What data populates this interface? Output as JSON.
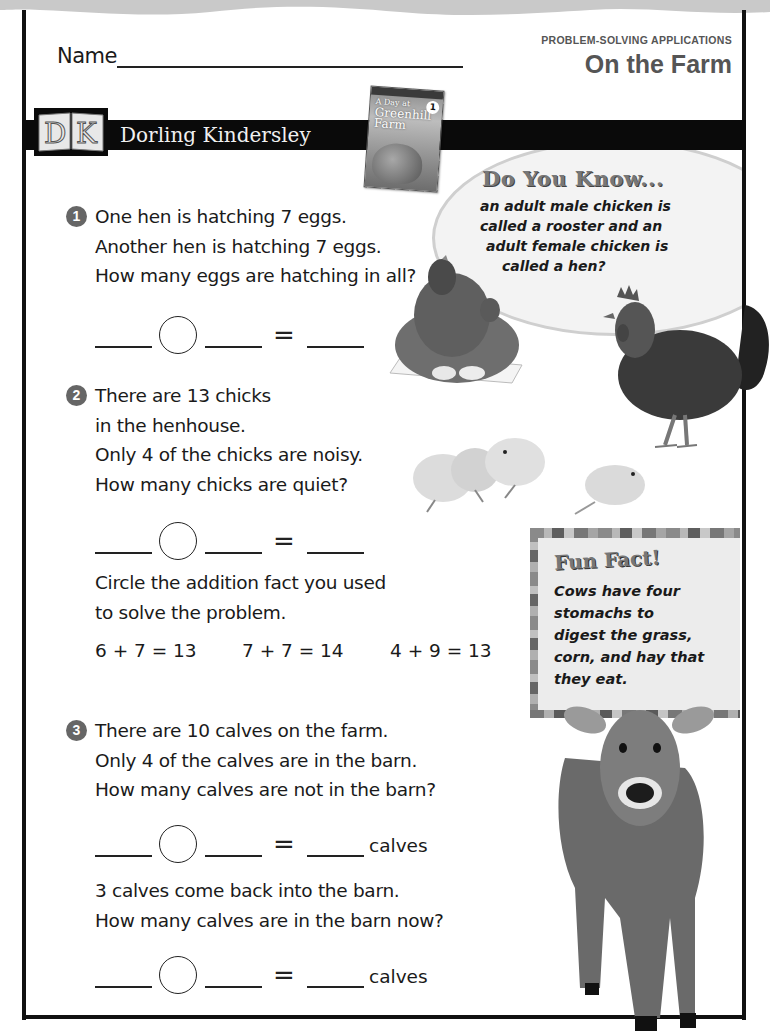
{
  "header": {
    "name_label": "Name",
    "section_label": "PROBLEM-SOLVING APPLICATIONS",
    "title": "On the Farm"
  },
  "publisher": {
    "logo_letters": "DK",
    "name": "Dorling Kindersley"
  },
  "book": {
    "title_line1": "A Day at",
    "title_line2": "Greenhill",
    "title_line3": "Farm",
    "level": "1"
  },
  "do_you_know": {
    "title": "Do You Know...",
    "lines": [
      "an adult male chicken is",
      "called a rooster and an",
      "adult female chicken is",
      "called a hen?"
    ]
  },
  "questions": [
    {
      "number": "1",
      "lines": [
        "One hen is hatching 7 eggs.",
        "Another hen is hatching 7 eggs.",
        "How many eggs are hatching in all?"
      ],
      "equation": {
        "equals": "=",
        "unit": ""
      }
    },
    {
      "number": "2",
      "lines": [
        "There are 13 chicks",
        "in the henhouse.",
        "Only 4 of the chicks are noisy.",
        "How many chicks are quiet?"
      ],
      "equation": {
        "equals": "=",
        "unit": ""
      },
      "followup_lines": [
        "Circle the addition fact you used",
        "to solve the problem."
      ],
      "facts": [
        "6 + 7 = 13",
        "7 + 7 = 14",
        "4 + 9 = 13"
      ]
    },
    {
      "number": "3",
      "lines": [
        "There are 10 calves on the farm.",
        "Only 4 of the calves are in the barn.",
        "How many calves are not in the barn?"
      ],
      "equation": {
        "equals": "=",
        "unit": "calves"
      },
      "followup_lines": [
        "3 calves come back into the barn.",
        "How many calves are in the barn now?"
      ],
      "equation2": {
        "equals": "=",
        "unit": "calves"
      }
    }
  ],
  "fun_fact": {
    "title": "Fun Fact!",
    "lines": [
      "Cows have four",
      "stomachs to",
      "digest the grass,",
      "corn, and hay that",
      "they eat."
    ]
  },
  "images": {
    "hen": "hen-on-eggs-photo",
    "rooster": "rooster-photo",
    "chicks": "chicks-photo",
    "calf": "calf-photo"
  }
}
